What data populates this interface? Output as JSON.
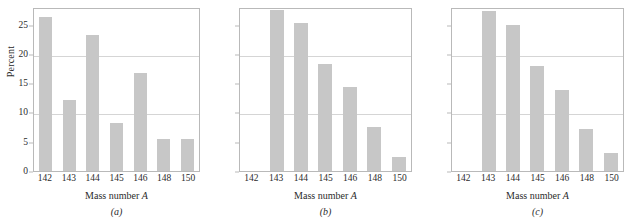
{
  "figure": {
    "panels": [
      {
        "subcaption": "(a)",
        "ylabel": "Percent",
        "xlabel_text": "Mass number ",
        "xlabel_italic": "A",
        "show_ylabels": true
      },
      {
        "subcaption": "(b)",
        "ylabel": "",
        "xlabel_text": "Mass number ",
        "xlabel_italic": "A",
        "show_ylabels": false
      },
      {
        "subcaption": "(c)",
        "ylabel": "",
        "xlabel_text": "Mass number ",
        "xlabel_italic": "A",
        "show_ylabels": false
      }
    ],
    "bar_color": "#c7c7c7",
    "frame_color": "#b9b9b9",
    "grid_color": "#d5d5d5"
  },
  "chart_data": [
    {
      "type": "bar",
      "title": "(a)",
      "xlabel": "Mass number A",
      "ylabel": "Percent",
      "categories": [
        "142",
        "143",
        "144",
        "145",
        "146",
        "148",
        "150"
      ],
      "values": [
        26.3,
        12.2,
        23.2,
        8.2,
        16.8,
        5.4,
        5.4
      ],
      "ylim": [
        0,
        28
      ],
      "yticks": [
        0,
        5,
        10,
        15,
        20,
        25
      ],
      "ytick_labels": [
        "0",
        "5",
        "10",
        "15",
        "20",
        "25"
      ],
      "gridlines": [
        10,
        20
      ],
      "grid": true,
      "legend": null
    },
    {
      "type": "bar",
      "title": "(b)",
      "xlabel": "Mass number A",
      "ylabel": "Percent",
      "categories": [
        "142",
        "143",
        "144",
        "145",
        "146",
        "148",
        "150"
      ],
      "values": [
        0,
        27.5,
        25.3,
        18.3,
        14.3,
        7.6,
        2.4
      ],
      "ylim": [
        0,
        28
      ],
      "yticks": [
        0,
        5,
        10,
        15,
        20,
        25
      ],
      "ytick_labels": [
        "0",
        "5",
        "10",
        "15",
        "20",
        "25"
      ],
      "gridlines": [
        10,
        20
      ],
      "grid": true,
      "legend": null
    },
    {
      "type": "bar",
      "title": "(c)",
      "xlabel": "Mass number A",
      "ylabel": "Percent",
      "categories": [
        "142",
        "143",
        "144",
        "145",
        "146",
        "148",
        "150"
      ],
      "values": [
        0,
        27.3,
        25.0,
        18.0,
        13.9,
        7.1,
        3.0
      ],
      "ylim": [
        0,
        28
      ],
      "yticks": [
        0,
        5,
        10,
        15,
        20,
        25
      ],
      "ytick_labels": [
        "0",
        "5",
        "10",
        "15",
        "20",
        "25"
      ],
      "gridlines": [
        10,
        20
      ],
      "grid": true,
      "legend": null
    }
  ]
}
